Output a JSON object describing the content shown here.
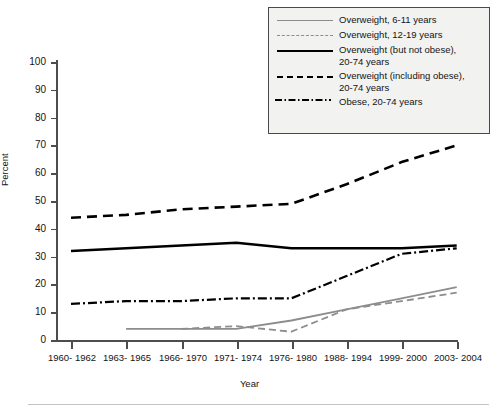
{
  "chart_data": {
    "type": "line",
    "title": "",
    "xlabel": "Year",
    "ylabel": "Percent",
    "ylim": [
      0,
      100
    ],
    "ytick_step": 10,
    "grid": false,
    "legend_position": "top-right",
    "categories": [
      "1960-\n1962",
      "1963-\n1965",
      "1966-\n1970",
      "1971-\n1974",
      "1976-\n1980",
      "1988-\n1994",
      "1999-\n2000",
      "2003-\n2004"
    ],
    "ytick_labels": [
      "100",
      "90",
      "80",
      "70",
      "60",
      "50",
      "40",
      "30",
      "20",
      "10",
      "0"
    ],
    "series": [
      {
        "name": "Overweight, 6-11 years",
        "style": "gray-solid",
        "color": "#8d8d8d",
        "values": [
          null,
          4,
          4,
          4,
          7,
          11,
          15,
          19
        ]
      },
      {
        "name": "Overweight, 12-19 years",
        "style": "gray-dashed",
        "color": "#8d8d8d",
        "values": [
          null,
          null,
          4,
          5,
          3,
          11,
          14,
          17
        ]
      },
      {
        "name": "Overweight (but not obese),\n20-74 years",
        "style": "black-solid",
        "color": "#000000",
        "values": [
          32,
          33,
          34,
          35,
          33,
          33,
          33,
          34
        ]
      },
      {
        "name": "Overweight (including obese),\n20-74 years",
        "style": "black-dashed",
        "color": "#000000",
        "values": [
          44,
          45,
          47,
          48,
          49,
          56,
          64,
          70
        ]
      },
      {
        "name": "Obese, 20-74 years",
        "style": "black-dash-dot",
        "color": "#000000",
        "values": [
          13,
          14,
          14,
          15,
          15,
          23,
          31,
          33
        ]
      }
    ]
  },
  "legend": {
    "items": [
      {
        "label": "Overweight, 6-11 years",
        "sample": "gray-solid"
      },
      {
        "label": "Overweight, 12-19 years",
        "sample": "gray-dashed"
      },
      {
        "label": "Overweight (but not obese),\n20-74 years",
        "sample": "black-solid"
      },
      {
        "label": "Overweight (including obese),\n20-74 years",
        "sample": "black-dashed"
      },
      {
        "label": "Obese, 20-74 years",
        "sample": "black-dash-dot"
      }
    ]
  },
  "axes": {
    "y_title": "Percent",
    "x_title": "Year"
  }
}
